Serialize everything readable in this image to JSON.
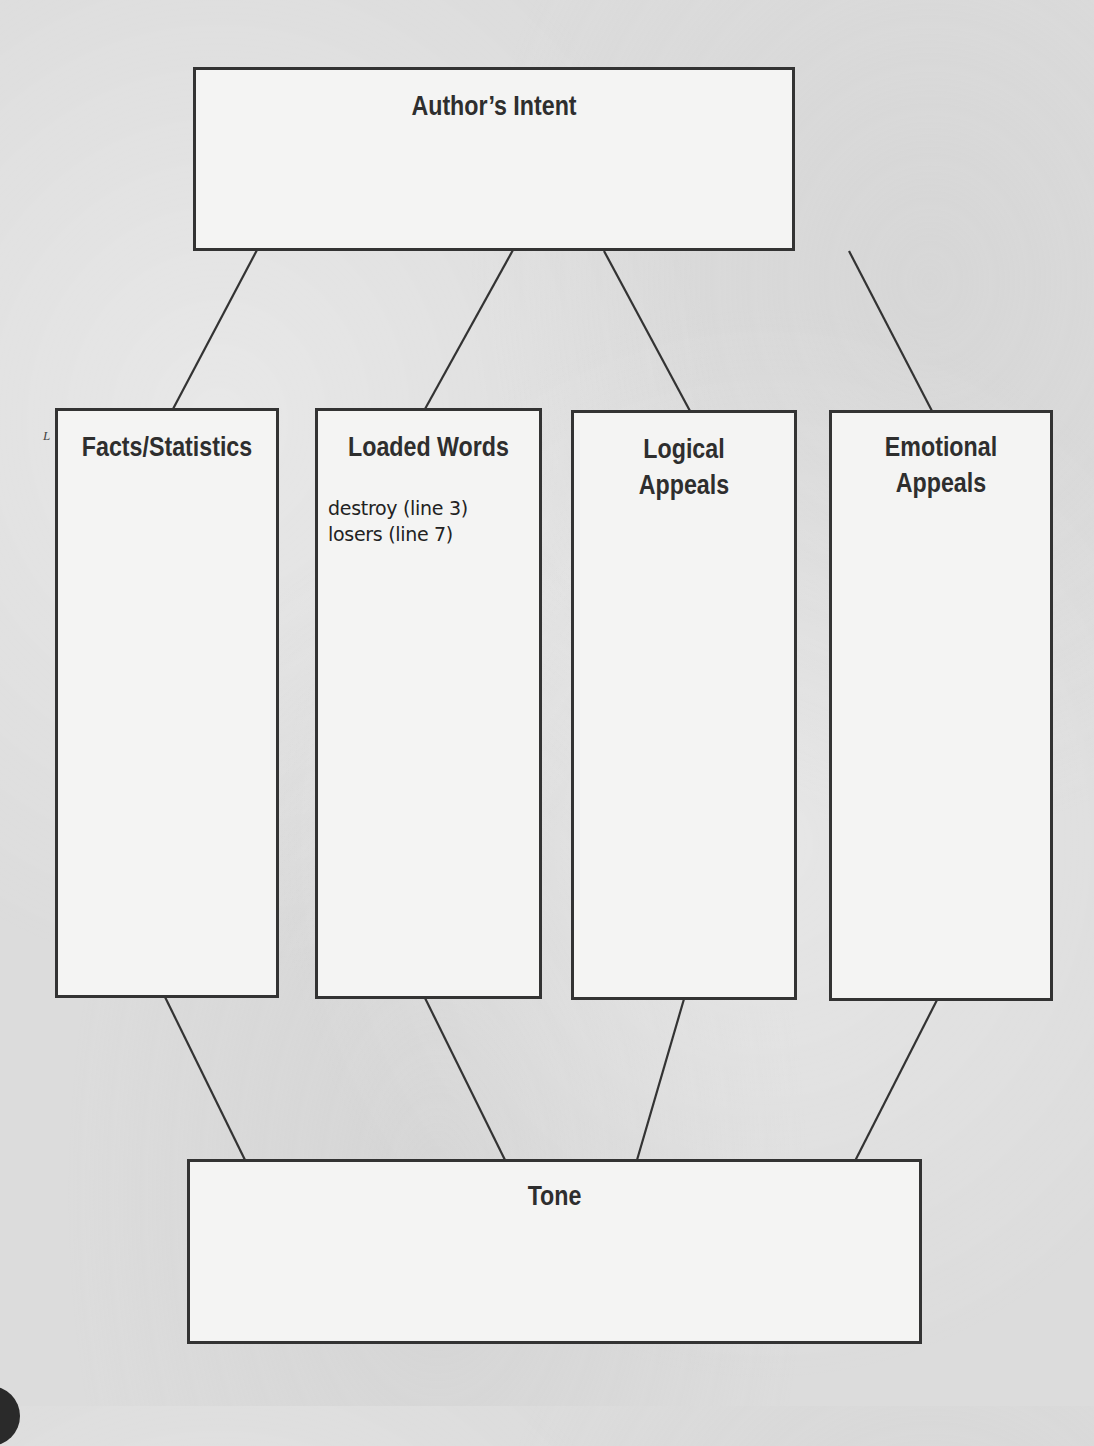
{
  "organizer": {
    "top": {
      "title": "Author’s Intent"
    },
    "columns": [
      {
        "title": "Facts/Statistics",
        "entries": []
      },
      {
        "title": "Loaded Words",
        "entries": [
          "destroy (line 3)",
          "losers (line 7)"
        ]
      },
      {
        "title": "Logical\nAppeals",
        "entries": []
      },
      {
        "title": "Emotional\nAppeals",
        "entries": []
      }
    ],
    "bottom": {
      "title": "Tone"
    }
  },
  "colors": {
    "line": "#333333",
    "box_fill": "#f4f4f3",
    "paper": "#dcdcdc",
    "title_text": "#2e2e2e"
  },
  "margin_mark": "L"
}
